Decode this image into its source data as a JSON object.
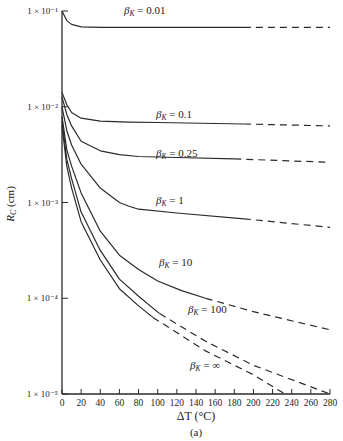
{
  "chart_data": {
    "type": "line",
    "title": "",
    "subtitle": "(a)",
    "xlabel": "ΔT (°C)",
    "ylabel": "R_C (cm)",
    "xlim": [
      0,
      280
    ],
    "ylim": [
      1e-05,
      0.1
    ],
    "yscale": "log",
    "grid": false,
    "legend_position": "inline labels",
    "x_ticks": [
      0,
      20,
      40,
      60,
      80,
      100,
      120,
      140,
      160,
      180,
      200,
      220,
      240,
      260,
      280
    ],
    "y_ticks": [
      {
        "value": 0.1,
        "label": "1 × 10⁻¹"
      },
      {
        "value": 0.01,
        "label": "1 × 10⁻²"
      },
      {
        "value": 0.001,
        "label": "1 × 10⁻³"
      },
      {
        "value": 0.0001,
        "label": "1 × 10⁻⁴"
      },
      {
        "value": 1e-05,
        "label": "1 × 10⁻⁵"
      }
    ],
    "series": [
      {
        "name": "β_K = 0.01",
        "label_text": "β",
        "label_sub": "K",
        "label_val": " = 0.01",
        "label_pos": [
          124,
          14
        ],
        "x": [
          0,
          5,
          10,
          20,
          40,
          100,
          190,
          280
        ],
        "log10_y": [
          -1.0,
          -1.1,
          -1.14,
          -1.165,
          -1.17,
          -1.17,
          -1.17,
          -1.17
        ],
        "solid_until": 190
      },
      {
        "name": "β_K = 0.1",
        "label_text": "β",
        "label_sub": "K",
        "label_val": " = 0.1",
        "label_pos": [
          156,
          118
        ],
        "x": [
          0,
          5,
          10,
          20,
          40,
          70,
          100,
          190,
          280
        ],
        "log10_y": [
          -1.85,
          -1.98,
          -2.06,
          -2.12,
          -2.15,
          -2.16,
          -2.165,
          -2.18,
          -2.2
        ],
        "solid_until": 190
      },
      {
        "name": "β_K = 0.25",
        "label_text": "β",
        "label_sub": "K",
        "label_val": " = 0.25",
        "label_pos": [
          156,
          157
        ],
        "x": [
          0,
          5,
          10,
          20,
          40,
          60,
          80,
          120,
          180,
          280
        ],
        "log10_y": [
          -1.9,
          -2.08,
          -2.2,
          -2.36,
          -2.46,
          -2.5,
          -2.52,
          -2.53,
          -2.545,
          -2.58
        ],
        "solid_until": 180
      },
      {
        "name": "β_K = 1",
        "label_text": "β",
        "label_sub": "K",
        "label_val": " = 1",
        "label_pos": [
          156,
          204
        ],
        "x": [
          0,
          5,
          10,
          20,
          40,
          60,
          70,
          80,
          120,
          190,
          280
        ],
        "log10_y": [
          -2.0,
          -2.25,
          -2.4,
          -2.6,
          -2.85,
          -3.0,
          -3.04,
          -3.07,
          -3.11,
          -3.17,
          -3.26
        ],
        "solid_until": 190
      },
      {
        "name": "β_K = 10",
        "label_text": "β",
        "label_sub": "K",
        "label_val": " = 10",
        "label_pos": [
          159,
          266
        ],
        "x": [
          0,
          5,
          10,
          20,
          40,
          60,
          80,
          100,
          125,
          150,
          200,
          280
        ],
        "log10_y": [
          -2.1,
          -2.45,
          -2.62,
          -2.9,
          -3.3,
          -3.55,
          -3.7,
          -3.82,
          -3.92,
          -4.0,
          -4.14,
          -4.33
        ],
        "solid_until": 150
      },
      {
        "name": "β_K = 100",
        "label_text": "β",
        "label_sub": "K",
        "label_val": " = 100",
        "label_pos": [
          188,
          313
        ],
        "x": [
          0,
          5,
          10,
          20,
          40,
          60,
          80,
          102,
          150,
          200,
          280
        ],
        "log10_y": [
          -2.15,
          -2.55,
          -2.75,
          -3.1,
          -3.5,
          -3.8,
          -3.98,
          -4.16,
          -4.45,
          -4.7,
          -5.0
        ],
        "solid_until": 102
      },
      {
        "name": "β_K = ∞",
        "label_text": "β",
        "label_sub": "K",
        "label_val": " = ∞",
        "label_pos": [
          190,
          369
        ],
        "x": [
          0,
          5,
          10,
          20,
          40,
          60,
          80,
          95,
          150,
          200,
          233
        ],
        "log10_y": [
          -2.2,
          -2.62,
          -2.85,
          -3.2,
          -3.6,
          -3.9,
          -4.08,
          -4.2,
          -4.55,
          -4.8,
          -5.0
        ],
        "solid_until": 95
      }
    ]
  },
  "layout": {
    "plot_left_px": 62,
    "plot_right_px": 330,
    "plot_top_px": 11,
    "plot_bottom_px": 394,
    "line_color": "#2a2a2a",
    "background": "#ffffff"
  }
}
